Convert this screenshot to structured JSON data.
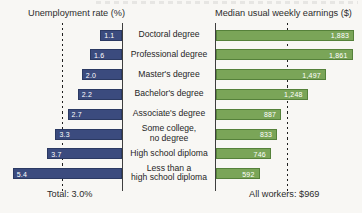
{
  "colors": {
    "unemployment_bar": "#3b4b7e",
    "earnings_bar": "#7aa558",
    "axis": "#3e3e3e",
    "reference_line": "#1f1f1f",
    "bar_value_text": "#ffffff",
    "label_text": "#262626",
    "background": "#f8f7f4"
  },
  "chart_data": {
    "type": "bar",
    "orientation": "horizontal-paired",
    "grid": false,
    "legend_position": "none",
    "categories": [
      "Doctoral degree",
      "Professional degree",
      "Master's degree",
      "Bachelor's degree",
      "Associate's degree",
      "Some college,\nno degree",
      "High school diploma",
      "Less than a\nhigh school diploma"
    ],
    "series": [
      {
        "name": "Unemployment rate (%)",
        "direction": "left",
        "values": [
          1.1,
          1.6,
          2.0,
          2.2,
          2.7,
          3.3,
          3.7,
          5.4
        ],
        "labels": [
          "1.1",
          "1.6",
          "2.0",
          "2.2",
          "2.7",
          "3.3",
          "3.7",
          "5.4"
        ],
        "reference_line": {
          "value": 3.0,
          "label": "Total: 3.0%"
        }
      },
      {
        "name": "Median usual weekly earnings ($)",
        "direction": "right",
        "values": [
          1883,
          1861,
          1497,
          1248,
          887,
          833,
          746,
          592
        ],
        "labels": [
          "1,883",
          "1,861",
          "1,497",
          "1,248",
          "887",
          "833",
          "746",
          "592"
        ],
        "reference_line": {
          "value": 969,
          "label": "All workers: $969"
        }
      }
    ]
  }
}
